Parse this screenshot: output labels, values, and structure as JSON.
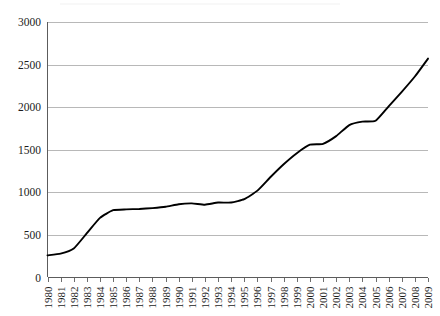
{
  "chart_data": {
    "type": "line",
    "title": "",
    "subtitle": "",
    "xlabel": "",
    "ylabel": "",
    "xlim": [
      1980,
      2009
    ],
    "ylim": [
      0,
      3000
    ],
    "grid": true,
    "legend": false,
    "legend_position": "none",
    "line_color": "#000000",
    "grid_color": "#9a9a9a",
    "y_ticks": [
      0,
      500,
      1000,
      1500,
      2000,
      2500,
      3000
    ],
    "y_tick_labels": [
      "0",
      "500",
      "1000",
      "1500",
      "2000",
      "2500",
      "3000"
    ],
    "categories": [
      "1980",
      "1981",
      "1982",
      "1983",
      "1984",
      "1985",
      "1986",
      "1987",
      "1988",
      "1989",
      "1990",
      "1991",
      "1992",
      "1993",
      "1994",
      "1995",
      "1996",
      "1997",
      "1998",
      "1999",
      "2000",
      "2001",
      "2002",
      "2003",
      "2004",
      "2005",
      "2006",
      "2007",
      "2008",
      "2009"
    ],
    "x": [
      1980,
      1981,
      1982,
      1983,
      1984,
      1985,
      1986,
      1987,
      1988,
      1989,
      1990,
      1991,
      1992,
      1993,
      1994,
      1995,
      1996,
      1997,
      1998,
      1999,
      2000,
      2001,
      2002,
      2003,
      2004,
      2005,
      2006,
      2007,
      2008,
      2009
    ],
    "values": [
      260,
      280,
      340,
      520,
      700,
      790,
      800,
      805,
      815,
      830,
      860,
      870,
      855,
      880,
      880,
      920,
      1020,
      1180,
      1330,
      1460,
      1560,
      1570,
      1660,
      1790,
      1830,
      1840,
      2010,
      2180,
      2360,
      2570
    ],
    "series": [
      {
        "name": "",
        "values": [
          260,
          280,
          340,
          520,
          700,
          790,
          800,
          805,
          815,
          830,
          860,
          870,
          855,
          880,
          880,
          920,
          1020,
          1180,
          1330,
          1460,
          1560,
          1570,
          1660,
          1790,
          1830,
          1840,
          2010,
          2180,
          2360,
          2570
        ]
      }
    ]
  },
  "axes": {
    "y_labels": [
      "3000",
      "2500",
      "2000",
      "1500",
      "1000",
      "500",
      "0"
    ],
    "x_labels": [
      "1980",
      "1981",
      "1982",
      "1983",
      "1984",
      "1985",
      "1986",
      "1987",
      "1988",
      "1989",
      "1990",
      "1991",
      "1992",
      "1993",
      "1994",
      "1995",
      "1996",
      "1997",
      "1998",
      "1999",
      "2000",
      "2001",
      "2002",
      "2003",
      "2004",
      "2005",
      "2006",
      "2007",
      "2008",
      "2009"
    ]
  }
}
